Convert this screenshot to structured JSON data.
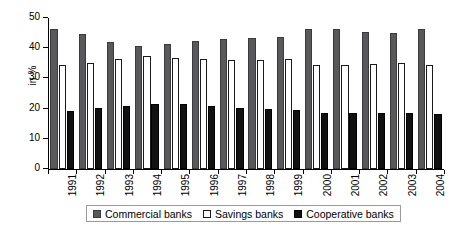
{
  "chart_data": {
    "type": "bar",
    "title": "",
    "xlabel": "",
    "ylabel": "in %",
    "ylim": [
      0,
      50
    ],
    "yticks": [
      0,
      10,
      20,
      30,
      40,
      50
    ],
    "grid": false,
    "legend_position": "bottom",
    "categories": [
      "1991",
      "1992",
      "1993",
      "1994",
      "1995",
      "1996",
      "1997",
      "1998",
      "1999",
      "2000",
      "2001",
      "2002",
      "2003",
      "2004"
    ],
    "series": [
      {
        "name": "Commercial banks",
        "color": "#59595b",
        "values": [
          46.3,
          44.8,
          42.2,
          40.8,
          41.3,
          42.3,
          43.2,
          43.5,
          43.8,
          46.2,
          46.2,
          45.4,
          45.1,
          46.3
        ]
      },
      {
        "name": "Savings banks",
        "color": "#ffffff",
        "values": [
          34.5,
          35.0,
          36.5,
          37.3,
          36.9,
          36.4,
          36.2,
          36.1,
          36.3,
          34.5,
          34.4,
          34.9,
          35.0,
          34.4
        ]
      },
      {
        "name": "Cooperative banks",
        "color": "#111111",
        "values": [
          19.2,
          20.3,
          21.0,
          21.6,
          21.4,
          20.9,
          20.3,
          19.8,
          19.5,
          18.4,
          18.4,
          18.5,
          18.4,
          18.3
        ]
      }
    ]
  },
  "legend": {
    "items": [
      {
        "label": "Commercial banks"
      },
      {
        "label": "Savings banks"
      },
      {
        "label": "Cooperative banks"
      }
    ]
  }
}
